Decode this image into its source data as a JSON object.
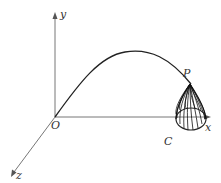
{
  "diagram": {
    "labels": {
      "y_axis": "y",
      "x_axis": "x",
      "z_axis": "z",
      "origin": "O",
      "point": "P",
      "curve": "C"
    },
    "colors": {
      "axis": "#777777",
      "curve": "#222222",
      "cone": "#111111",
      "text": "#333333"
    }
  }
}
